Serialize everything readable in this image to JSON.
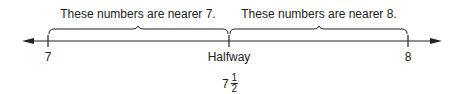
{
  "number_line": {
    "start_label": "7",
    "mid_label": "Halfway",
    "end_label": "8",
    "mid_value": {
      "whole": "7",
      "numerator": "1",
      "denominator": "2"
    }
  },
  "braces": [
    {
      "label": "These numbers are nearer 7."
    },
    {
      "label": "These numbers are nearer 8."
    }
  ],
  "colors": {
    "line": "#222222",
    "text": "#222222"
  }
}
